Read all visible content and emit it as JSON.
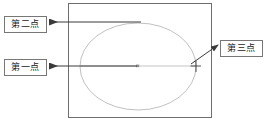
{
  "diagram": {
    "drawing_area": {
      "name": "drawing-frame",
      "border_color": "#6e6e6e",
      "fill_color": "#ffffff",
      "x": 68,
      "y": 3,
      "width": 144,
      "height": 115
    },
    "ellipse": {
      "name": "ellipse-shape",
      "stroke_color": "#b9b9b9",
      "cx": 138,
      "cy": 66.5,
      "rx": 58,
      "ry": 43.5
    },
    "major_axis_line": {
      "name": "major-axis-line",
      "stroke_color": "#9a9a9a",
      "x1": 80,
      "y1": 66,
      "x2": 196,
      "y2": 66
    },
    "center_marker": {
      "name": "ellipse-center-point",
      "x": 138,
      "y": 66,
      "color": "#8f8f8f"
    },
    "crosshair_marker": {
      "name": "third-point-crosshair",
      "x": 196,
      "y": 66,
      "size": 8,
      "color": "#444444"
    }
  },
  "labels": {
    "second_point": {
      "text": "第二点",
      "name": "label-second-point",
      "arrow": {
        "from_x": 140,
        "from_y": 22,
        "to_x": 49,
        "to_y": 22
      }
    },
    "first_point": {
      "text": "第一点",
      "name": "label-first-point",
      "arrow": {
        "from_x": 137,
        "from_y": 66,
        "to_x": 49,
        "to_y": 66
      }
    },
    "third_point": {
      "text": "第三点",
      "name": "label-third-point",
      "arrow": {
        "from_x": 193,
        "from_y": 63,
        "to_x": 218,
        "to_y": 45
      }
    }
  },
  "colors": {
    "frame_stroke": "#6e6e6e",
    "ellipse_stroke": "#b9b9b9",
    "arrow_stroke": "#3a3a3a",
    "box_border": "#777777",
    "text": "#1a1a1a",
    "background": "#ffffff"
  }
}
